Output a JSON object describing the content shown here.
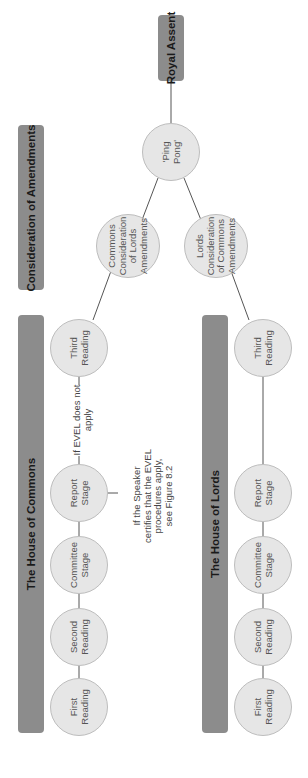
{
  "sections": {
    "consideration": "Consideration of Amendments",
    "commons": "The House of Commons",
    "lords": "The House of Lords",
    "royal_assent": "Royal Assent"
  },
  "nodes": {
    "ping_pong": "'Ping\nPong'",
    "commons_consideration": "Commons\nConsideration\nof Lords\nAmendments",
    "lords_consideration": "Lords\nConsideration\nof Commons\nAmendments",
    "commons": {
      "first": "First\nReading",
      "second": "Second\nReading",
      "committee": "Committee\nStage",
      "report": "Report\nStage",
      "third": "Third\nReading"
    },
    "lords": {
      "first": "First\nReading",
      "second": "Second\nReading",
      "committee": "Committee\nStage",
      "report": "Report\nStage",
      "third": "Third\nReading"
    }
  },
  "notes": {
    "evel_not_apply": "If EVEL does not\napply",
    "evel_apply": "If the Speaker\ncertifies that the EVEL\nprocedures apply,\nsee Figure 8.2"
  },
  "colors": {
    "section_box": "#8c8c8c",
    "node_fill": "#e6e6e6",
    "line": "#555555"
  }
}
